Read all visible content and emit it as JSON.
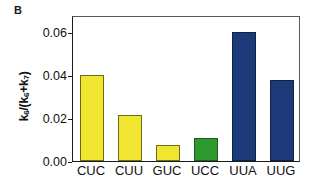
{
  "panel": {
    "label": "B"
  },
  "chart_data": {
    "type": "bar",
    "title": "",
    "subtitle": "",
    "xlabel": "",
    "ylabel": "k6/(k6+k7)",
    "ylabel_parts": {
      "k_main": "k",
      "sub6a": "6",
      "slash_open": "/(",
      "k_b": "k",
      "sub6b": "6",
      "plus": "+",
      "k_c": "k",
      "sub7": "7",
      "close": ")"
    },
    "categories": [
      "CUC",
      "CUU",
      "GUC",
      "UCC",
      "UUA",
      "UUG"
    ],
    "values": [
      0.04,
      0.0215,
      0.0075,
      0.0105,
      0.06,
      0.0378
    ],
    "bar_colors": [
      "#f0e632",
      "#f0e632",
      "#f0e632",
      "#2e9a2e",
      "#1b3a77",
      "#1b3a77"
    ],
    "bar_edge_colors": [
      "#6b6b18",
      "#6b6b18",
      "#6b6b18",
      "#1d5c1d",
      "#0f2347",
      "#0f2347"
    ],
    "ylim": [
      0.0,
      0.068
    ],
    "yticks": [
      0.0,
      0.02,
      0.04,
      0.06
    ],
    "ytick_labels": [
      "0.00",
      "0.02",
      "0.04",
      "0.06"
    ],
    "grid": false,
    "legend": null,
    "legend_position": "none",
    "annotations": []
  },
  "colors": {
    "yellow": "#f0e632",
    "green": "#2e9a2e",
    "navy": "#1b3a77",
    "axis": "#1a1a1a",
    "text": "#111111",
    "background": "#ffffff"
  }
}
